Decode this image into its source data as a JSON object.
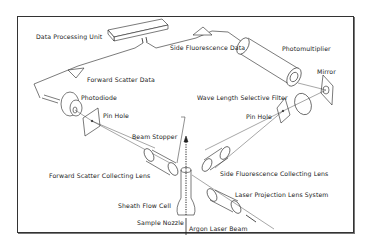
{
  "diagram": {
    "type": "flow cytometer optical system schematic",
    "labels": {
      "data_processing_unit": "Data Processing Unit",
      "side_fluorescence_data": "Side Fluorescence Data",
      "photomultiplier": "Photomultiplier",
      "forward_scatter_data": "Forward Scatter Data",
      "mirror": "Mirror",
      "photodiode": "Photodiode",
      "wave_length_selective_filter": "Wave Length Selective Filter",
      "pin_hole_left": "Pin Hole",
      "pin_hole_right": "Pin Hole",
      "beam_stopper": "Beam Stopper",
      "forward_scatter_collecting_lens": "Forward Scatter Collecting Lens",
      "side_fluorescence_collecting_lens": "Side Fluorescence Collecting Lens",
      "laser_projection_lens_system": "Laser Projection Lens System",
      "sheath_flow_cell": "Sheath Flow Cell",
      "sample_nozzle": "Sample Nozzle",
      "argon_laser_beam": "Argon Laser Beam"
    },
    "colors": {
      "line": "#222222",
      "border": "#333333",
      "background": "#ffffff"
    }
  }
}
